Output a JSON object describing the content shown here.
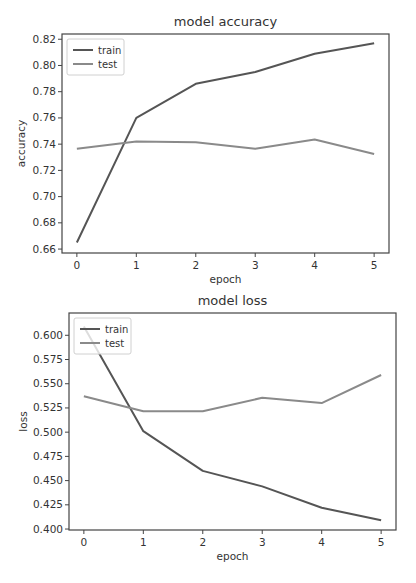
{
  "chart_data": [
    {
      "type": "line",
      "title": "model accuracy",
      "xlabel": "epoch",
      "ylabel": "accuracy",
      "x": [
        0,
        1,
        2,
        3,
        4,
        5
      ],
      "xticks": [
        "0",
        "1",
        "2",
        "3",
        "4",
        "5"
      ],
      "yticks": [
        "0.66",
        "0.68",
        "0.70",
        "0.72",
        "0.74",
        "0.76",
        "0.78",
        "0.80",
        "0.82"
      ],
      "ytick_values": [
        0.66,
        0.68,
        0.7,
        0.72,
        0.74,
        0.76,
        0.78,
        0.8,
        0.82
      ],
      "ylim": [
        0.657,
        0.824
      ],
      "xlim": [
        -0.25,
        5.25
      ],
      "grid": false,
      "legend_position": "upper left",
      "series": [
        {
          "name": "train",
          "color": "#555555",
          "values": [
            0.665,
            0.76,
            0.786,
            0.795,
            0.809,
            0.817
          ]
        },
        {
          "name": "test",
          "color": "#8a8a8a",
          "values": [
            0.7365,
            0.742,
            0.7415,
            0.7365,
            0.7435,
            0.7325
          ]
        }
      ]
    },
    {
      "type": "line",
      "title": "model loss",
      "xlabel": "epoch",
      "ylabel": "loss",
      "x": [
        0,
        1,
        2,
        3,
        4,
        5
      ],
      "xticks": [
        "0",
        "1",
        "2",
        "3",
        "4",
        "5"
      ],
      "yticks": [
        "0.400",
        "0.425",
        "0.450",
        "0.475",
        "0.500",
        "0.525",
        "0.550",
        "0.575",
        "0.600"
      ],
      "ytick_values": [
        0.4,
        0.425,
        0.45,
        0.475,
        0.5,
        0.525,
        0.55,
        0.575,
        0.6
      ],
      "ylim": [
        0.399,
        0.623
      ],
      "xlim": [
        -0.25,
        5.25
      ],
      "grid": false,
      "legend_position": "upper left",
      "series": [
        {
          "name": "train",
          "color": "#555555",
          "values": [
            0.609,
            0.501,
            0.46,
            0.444,
            0.422,
            0.409
          ]
        },
        {
          "name": "test",
          "color": "#8a8a8a",
          "values": [
            0.537,
            0.5215,
            0.5215,
            0.5355,
            0.53,
            0.559
          ]
        }
      ]
    }
  ],
  "layout": [
    {
      "top": 0,
      "height": 290,
      "frame": {
        "x": 62,
        "y": 34,
        "w": 327,
        "h": 219
      }
    },
    {
      "top": 290,
      "height": 293,
      "frame": {
        "x": 69,
        "y": 23,
        "w": 327,
        "h": 217
      }
    }
  ]
}
